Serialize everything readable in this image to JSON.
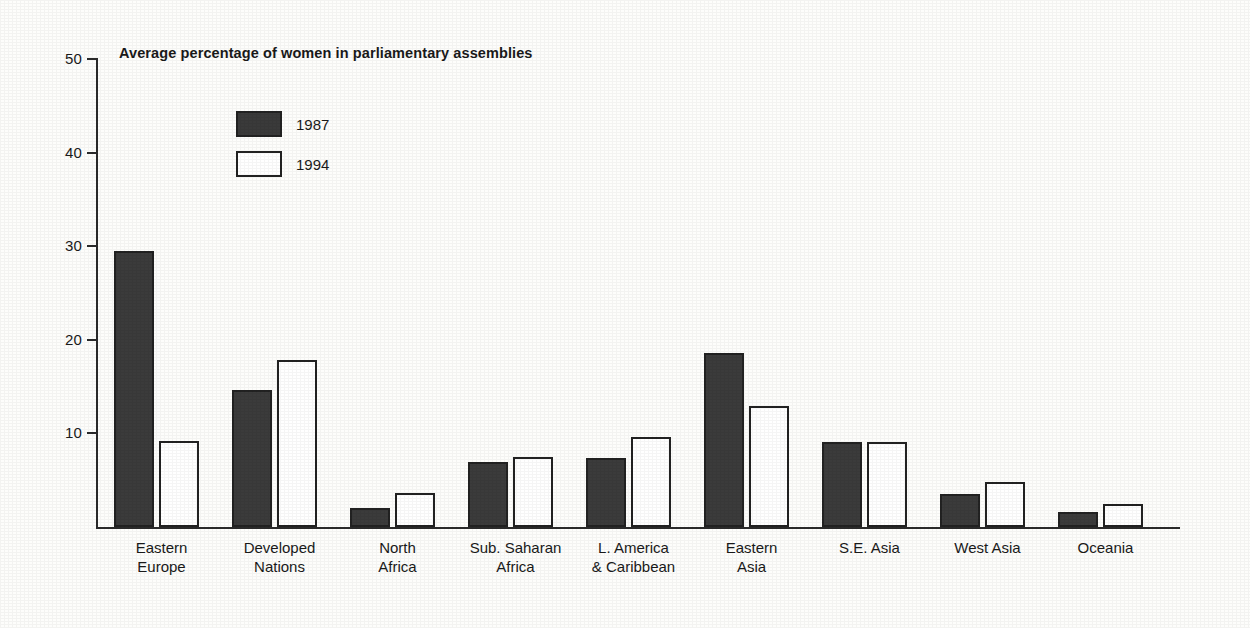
{
  "chart_data": {
    "type": "bar",
    "title": "Average percentage of women in parliamentary assemblies",
    "xlabel": "",
    "ylabel": "",
    "ylim": [
      0,
      50
    ],
    "yticks": [
      10,
      20,
      30,
      40,
      50
    ],
    "ytick_labels": [
      "10",
      "20",
      "30",
      "40",
      "50"
    ],
    "grid": false,
    "legend_position": "upper-left-inside",
    "categories": [
      "Eastern\nEurope",
      "Developed\nNations",
      "North\nAfrica",
      "Sub. Saharan\nAfrica",
      "L. America\n& Caribbean",
      "Eastern\nAsia",
      "S.E. Asia",
      "West Asia",
      "Oceania"
    ],
    "series": [
      {
        "name": "1987",
        "color": "#3b3b3b",
        "values": [
          29.5,
          14.6,
          2.0,
          6.9,
          7.4,
          18.6,
          9.1,
          3.5,
          1.6
        ]
      },
      {
        "name": "1994",
        "color": "#ffffff",
        "values": [
          9.2,
          17.9,
          3.6,
          7.5,
          9.6,
          12.9,
          9.1,
          4.8,
          2.5
        ]
      }
    ]
  },
  "legend": {
    "items": [
      {
        "label": "1987",
        "swatch": "dark-filled-swatch"
      },
      {
        "label": "1994",
        "swatch": "white-outlined-swatch"
      }
    ]
  }
}
